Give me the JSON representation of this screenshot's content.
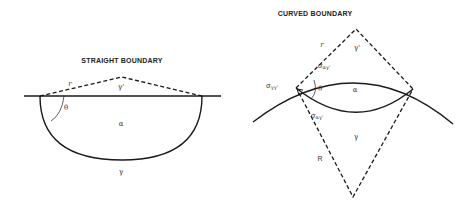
{
  "straight": {
    "title": "STRAIGHT BOUNDARY",
    "labels": {
      "r": "r",
      "gamma_prime": "γ'",
      "theta": "θ",
      "alpha": "α",
      "gamma": "γ"
    }
  },
  "curved": {
    "title": "CURVED BOUNDARY",
    "labels": {
      "r": "r",
      "gamma_prime": "γ'",
      "sigma_agp_top": "σ",
      "sigma_agp_top_sub": "αγ'",
      "sigma_ggp": "σ",
      "sigma_ggp_sub": "γγ'",
      "theta": "θ",
      "alpha": "α",
      "sigma_agp_bottom": "σ",
      "sigma_agp_bottom_sub": "αγ'",
      "gamma": "γ",
      "R": "R"
    }
  },
  "colors": {
    "line": "#1a1a1a",
    "text": "#333333",
    "background": "#ffffff"
  }
}
